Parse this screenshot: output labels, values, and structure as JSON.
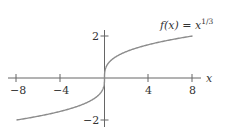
{
  "chart_data": {
    "type": "line",
    "function_label": {
      "prefix": "f(x) = x",
      "superscript": "1/3"
    },
    "xlabel": "x",
    "ylabel": "",
    "xlim": [
      -8.8,
      8.8
    ],
    "ylim": [
      -2.1,
      2.1
    ],
    "x_ticks": [
      -8,
      -4,
      4,
      8
    ],
    "x_tick_labels": [
      "−8",
      "−4",
      "4",
      "8"
    ],
    "y_ticks": [
      2,
      -2
    ],
    "y_tick_labels": [
      "2",
      "−2"
    ],
    "grid": false,
    "series": [
      {
        "name": "f(x) = x^(1/3)",
        "color": "#8c8c8c",
        "x": [
          -8,
          -6,
          -4,
          -2,
          -1,
          -0.5,
          -0.1,
          0,
          0.1,
          0.5,
          1,
          2,
          4,
          6,
          8
        ],
        "y": [
          -2,
          -1.817,
          -1.587,
          -1.26,
          -1,
          -0.794,
          -0.464,
          0,
          0.464,
          0.794,
          1,
          1.26,
          1.587,
          1.817,
          2
        ]
      }
    ]
  }
}
